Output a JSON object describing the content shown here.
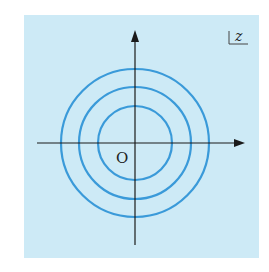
{
  "diagram": {
    "background_color": "#cdeaf6",
    "circle_color": "#3a9ad9",
    "axis_color": "#1a1a1a",
    "origin_label": "O",
    "corner_label": "z",
    "center": {
      "x": 135,
      "y": 143
    },
    "circles": [
      {
        "name": "inner",
        "r": 37
      },
      {
        "name": "middle",
        "r": 56
      },
      {
        "name": "outer",
        "r": 74
      }
    ]
  }
}
